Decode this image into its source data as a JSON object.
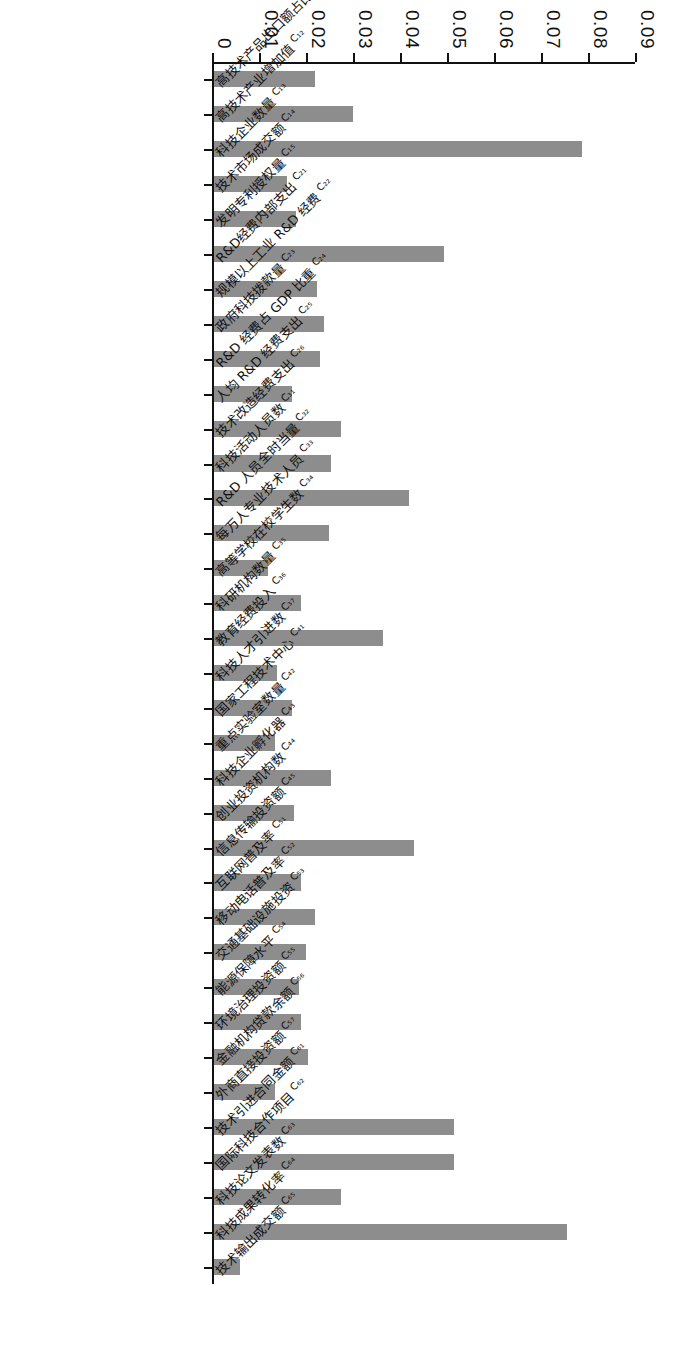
{
  "chart_data": {
    "type": "bar",
    "orientation": "horizontal-scan-rotated",
    "title": "",
    "subtitle": "",
    "xlabel": "",
    "ylabel": "",
    "ylim": [
      0,
      0.09
    ],
    "grid": false,
    "legend": null,
    "ytick_labels": [
      "0",
      "0.01",
      "0.02",
      "0.03",
      "0.04",
      "0.05",
      "0.06",
      "0.07",
      "0.08",
      "0.09"
    ],
    "ytick_values": [
      0,
      0.01,
      0.02,
      0.03,
      0.04,
      0.05,
      0.06,
      0.07,
      0.08,
      0.09
    ],
    "bar_color": "#8d8d8d",
    "axis_color": "#111111",
    "categories": [
      "高技术产品出口额占比 C₁₁",
      "高技术产业增加值 C₁₂",
      "科技企业数量 C₁₃",
      "技术市场成交额 C₁₄",
      "发明专利授权量 C₁₅",
      "R&D经费内部支出 C₂₁",
      "规模以上工业企业 R&D 经费 C₂₂",
      "政府科技拨款量 C₂₃",
      "R&D 经费占 GDP 比重 C₂₄",
      "人均 R&D 经费支出 C₂₅",
      "技术改造经费支出 C₂₆",
      "科技活动人员数 C₃₁",
      "R&D 人员全时当量 C₃₂",
      "每万人专业技术人员 C₃₃",
      "高等学校在校学生数 C₃₄",
      "科研机构数量 C₃₅",
      "教育经费投入 C₃₆",
      "科技人才引进数 C₃₇",
      "国家工程技术中心 C₄₁",
      "重点实验室数量 C₄₂",
      "科技企业孵化器 C₄₃",
      "创业投资机构数 C₄₄",
      "信息传输投资额 C₄₅",
      "互联网普及率 C₅₁",
      "移动电话普及率 C₅₂",
      "交通基础设施投资 C₅₃",
      "能源保障水平 C₅₄",
      "环境治理投资额 C₅₅",
      "金融机构贷款余额 C₅₆",
      "外商直接投资额 C₅₇",
      "技术引进合同金额 C₆₁",
      "国际科技合作项目 C₆₂",
      "科技论文发表数 C₆₃",
      "科技成果转化率 C₆₄",
      "技术输出成交额 C₆₅"
    ],
    "categories_full": [
      {
        "code": "C₁₁",
        "label": "高技术产品出口额占比",
        "value": 0.0215
      },
      {
        "code": "C₁₂",
        "label": "高技术产业增加值",
        "value": 0.0295
      },
      {
        "code": "C₁₃",
        "label": "科技企业数量",
        "value": 0.0782
      },
      {
        "code": "C₁₄",
        "label": "技术市场成交额",
        "value": 0.0155
      },
      {
        "code": "C₁₅",
        "label": "发明专利授权量",
        "value": 0.0175
      },
      {
        "code": "C₂₁",
        "label": "R&D经费内部支出",
        "value": 0.049
      },
      {
        "code": "C₂₂",
        "label": "规模以上工业 R&D 经费",
        "value": 0.022
      },
      {
        "code": "C₂₃",
        "label": "政府科技拨款量",
        "value": 0.0235
      },
      {
        "code": "C₂₄",
        "label": "R&D 经费占 GDP 比重",
        "value": 0.0225
      },
      {
        "code": "C₂₅",
        "label": "人均 R&D 经费支出",
        "value": 0.0165
      },
      {
        "code": "C₂₆",
        "label": "技术改造经费支出",
        "value": 0.027
      },
      {
        "code": "C₃₁",
        "label": "科技活动人员数",
        "value": 0.025
      },
      {
        "code": "C₃₂",
        "label": "R&D 人员全时当量",
        "value": 0.0415
      },
      {
        "code": "C₃₃",
        "label": "每万人专业技术人员",
        "value": 0.0245
      },
      {
        "code": "C₃₄",
        "label": "高等学校在校学生数",
        "value": 0.0115
      },
      {
        "code": "C₃₅",
        "label": "科研机构数量",
        "value": 0.0185
      },
      {
        "code": "C₃₆",
        "label": "教育经费投入",
        "value": 0.036
      },
      {
        "code": "C₃₇",
        "label": "科技人才引进数",
        "value": 0.0135
      },
      {
        "code": "C₄₁",
        "label": "国家工程技术中心",
        "value": 0.0165
      },
      {
        "code": "C₄₂",
        "label": "重点实验室数量",
        "value": 0.013
      },
      {
        "code": "C₄₃",
        "label": "科技企业孵化器",
        "value": 0.025
      },
      {
        "code": "C₄₄",
        "label": "创业投资机构数",
        "value": 0.017
      },
      {
        "code": "C₄₅",
        "label": "信息传输投资额",
        "value": 0.0425
      },
      {
        "code": "C₅₁",
        "label": "互联网普及率",
        "value": 0.0185
      },
      {
        "code": "C₅₂",
        "label": "移动电话普及率",
        "value": 0.0215
      },
      {
        "code": "C₅₃",
        "label": "交通基础设施投资",
        "value": 0.0195
      },
      {
        "code": "C₅₄",
        "label": "能源保障水平",
        "value": 0.018
      },
      {
        "code": "C₅₅",
        "label": "环境治理投资额",
        "value": 0.0185
      },
      {
        "code": "C₅₆",
        "label": "金融机构贷款余额",
        "value": 0.02
      },
      {
        "code": "C₅₇",
        "label": "外商直接投资额",
        "value": 0.013
      },
      {
        "code": "C₆₁",
        "label": "技术引进合同金额",
        "value": 0.051
      },
      {
        "code": "C₆₂",
        "label": "国际科技合作项目",
        "value": 0.051
      },
      {
        "code": "C₆₃",
        "label": "科技论文发表数",
        "value": 0.027
      },
      {
        "code": "C₆₄",
        "label": "科技成果转化率",
        "value": 0.0752
      },
      {
        "code": "C₆₅",
        "label": "技术输出成交额",
        "value": 0.0055
      }
    ],
    "values": [
      0.0215,
      0.0295,
      0.0782,
      0.0155,
      0.0175,
      0.049,
      0.022,
      0.0235,
      0.0225,
      0.0165,
      0.027,
      0.025,
      0.0415,
      0.0245,
      0.0115,
      0.0185,
      0.036,
      0.0135,
      0.0165,
      0.013,
      0.025,
      0.017,
      0.0425,
      0.0185,
      0.0215,
      0.0195,
      0.018,
      0.0185,
      0.02,
      0.013,
      0.051,
      0.051,
      0.027,
      0.0752,
      0.0055
    ]
  }
}
